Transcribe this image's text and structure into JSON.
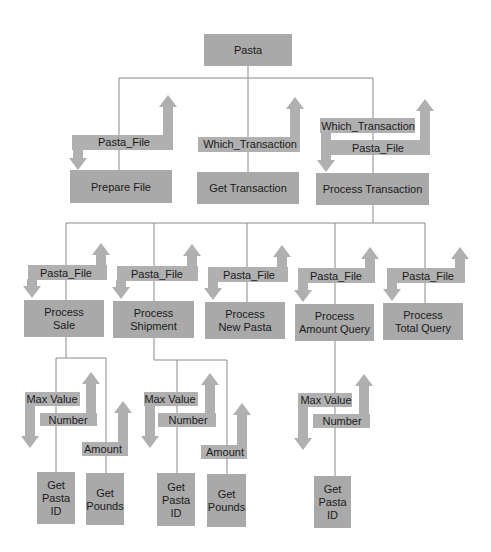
{
  "diagram": {
    "colors": {
      "box": "#a9a9a9",
      "arrow": "#b0b0b0",
      "line": "#8a8a8a",
      "text": "#1a1a1a"
    },
    "nodes": [
      {
        "id": "pasta",
        "lines": [
          "Pasta"
        ]
      },
      {
        "id": "prepare-file",
        "lines": [
          "Prepare File"
        ]
      },
      {
        "id": "get-transaction",
        "lines": [
          "Get Transaction"
        ]
      },
      {
        "id": "process-transaction",
        "lines": [
          "Process Transaction"
        ]
      },
      {
        "id": "process-sale",
        "lines": [
          "Process",
          "Sale"
        ]
      },
      {
        "id": "process-shipment",
        "lines": [
          "Process",
          "Shipment"
        ]
      },
      {
        "id": "process-new-pasta",
        "lines": [
          "Process",
          "New Pasta"
        ]
      },
      {
        "id": "process-amount-query",
        "lines": [
          "Process",
          "Amount Query"
        ]
      },
      {
        "id": "process-total-query",
        "lines": [
          "Process",
          "Total Query"
        ]
      },
      {
        "id": "sale-get-pasta-id",
        "lines": [
          "Get",
          "Pasta",
          "ID"
        ]
      },
      {
        "id": "sale-get-pounds",
        "lines": [
          "Get",
          "Pounds"
        ]
      },
      {
        "id": "shipment-get-pasta-id",
        "lines": [
          "Get",
          "Pasta",
          "ID"
        ]
      },
      {
        "id": "shipment-get-pounds",
        "lines": [
          "Get",
          "Pounds"
        ]
      },
      {
        "id": "amount-query-get-pasta-id",
        "lines": [
          "Get",
          "Pasta",
          "ID"
        ]
      }
    ],
    "edges": [
      {
        "from": "pasta",
        "to": "prepare-file"
      },
      {
        "from": "pasta",
        "to": "get-transaction"
      },
      {
        "from": "pasta",
        "to": "process-transaction"
      },
      {
        "from": "process-transaction",
        "to": "process-sale"
      },
      {
        "from": "process-transaction",
        "to": "process-shipment"
      },
      {
        "from": "process-transaction",
        "to": "process-new-pasta"
      },
      {
        "from": "process-transaction",
        "to": "process-amount-query"
      },
      {
        "from": "process-transaction",
        "to": "process-total-query"
      },
      {
        "from": "process-sale",
        "to": "sale-get-pasta-id"
      },
      {
        "from": "process-sale",
        "to": "sale-get-pounds"
      },
      {
        "from": "process-shipment",
        "to": "shipment-get-pasta-id"
      },
      {
        "from": "process-shipment",
        "to": "shipment-get-pounds"
      },
      {
        "from": "process-amount-query",
        "to": "amount-query-get-pasta-id"
      }
    ],
    "flows": [
      {
        "id": "prepare-file-pasta-file",
        "label": "Pasta_File",
        "direction": "down",
        "to": "prepare-file"
      },
      {
        "id": "get-transaction-which-transaction",
        "label": "Which_Transaction",
        "direction": "up",
        "to": "get-transaction"
      },
      {
        "id": "process-transaction-which-transaction",
        "label": "Which_Transaction",
        "direction": "down",
        "to": "process-transaction"
      },
      {
        "id": "process-transaction-pasta-file",
        "label": "Pasta_File",
        "direction": "up",
        "to": "process-transaction"
      },
      {
        "id": "process-sale-pasta-file",
        "label": "Pasta_File",
        "direction": "down",
        "to": "process-sale"
      },
      {
        "id": "process-shipment-pasta-file",
        "label": "Pasta_File",
        "direction": "down",
        "to": "process-shipment"
      },
      {
        "id": "process-new-pasta-pasta-file",
        "label": "Pasta_File",
        "direction": "down",
        "to": "process-new-pasta"
      },
      {
        "id": "process-amount-query-pasta-file",
        "label": "Pasta_File",
        "direction": "down",
        "to": "process-amount-query"
      },
      {
        "id": "process-total-query-pasta-file",
        "label": "Pasta_File",
        "direction": "down",
        "to": "process-total-query"
      },
      {
        "id": "sale-max-value",
        "label": "Max Value",
        "direction": "down",
        "to": "sale-get-pasta-id"
      },
      {
        "id": "sale-number",
        "label": "Number",
        "direction": "up",
        "to": "sale-get-pasta-id"
      },
      {
        "id": "sale-amount",
        "label": "Amount",
        "direction": "up",
        "to": "sale-get-pounds"
      },
      {
        "id": "shipment-max-value",
        "label": "Max Value",
        "direction": "down",
        "to": "shipment-get-pasta-id"
      },
      {
        "id": "shipment-number",
        "label": "Number",
        "direction": "up",
        "to": "shipment-get-pasta-id"
      },
      {
        "id": "shipment-amount",
        "label": "Amount",
        "direction": "up",
        "to": "shipment-get-pounds"
      },
      {
        "id": "amount-query-max-value",
        "label": "Max Value",
        "direction": "down",
        "to": "amount-query-get-pasta-id"
      },
      {
        "id": "amount-query-number",
        "label": "Number",
        "direction": "up",
        "to": "amount-query-get-pasta-id"
      }
    ]
  }
}
